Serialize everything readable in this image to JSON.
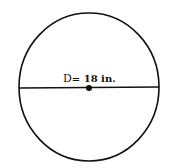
{
  "diagram": {
    "shape": "circle",
    "label_prefix": "D",
    "label_eq": "= ",
    "label_value": "18 in.",
    "colors": {
      "stroke": "#111111",
      "background": "#ffffff"
    }
  }
}
